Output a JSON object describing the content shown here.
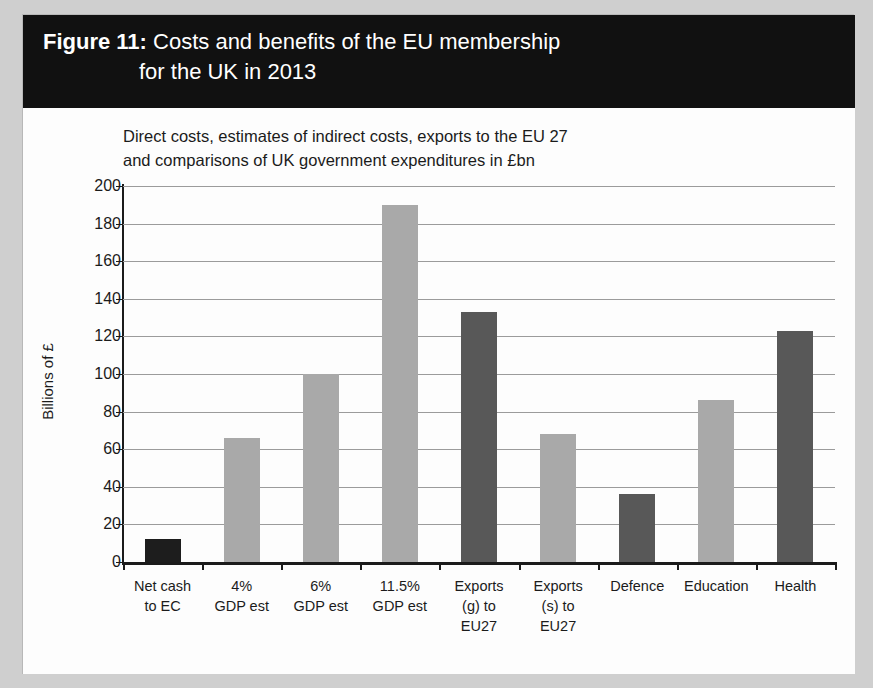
{
  "figure": {
    "label": "Figure 11:",
    "title_line1": "Costs and benefits of the EU membership",
    "title_line2": "for the UK in 2013",
    "banner_bg": "#111111",
    "banner_fg": "#ffffff"
  },
  "chart_data": {
    "type": "bar",
    "title": "Figure 11: Costs and benefits of the EU membership for the UK in 2013",
    "subtitle": "Direct costs, estimates of indirect costs, exports to the EU 27 and comparisons of UK government expenditures in £bn",
    "subtitle_line1": "Direct costs, estimates of indirect costs, exports to the EU 27",
    "subtitle_line2": "and comparisons of UK government expenditures in £bn",
    "xlabel": "",
    "ylabel": "Billions of £",
    "ylim": [
      0,
      200
    ],
    "ytick_step": 20,
    "yticks": [
      200,
      180,
      160,
      140,
      120,
      100,
      80,
      60,
      40,
      20,
      0
    ],
    "ytick_labels": [
      "200",
      "180",
      "160",
      "140",
      "120",
      "100",
      "80",
      "60",
      "40",
      "20",
      "0"
    ],
    "grid": true,
    "legend": "none",
    "categories": [
      "Net cash to EC",
      "4% GDP est",
      "6% GDP est",
      "11.5% GDP est",
      "Exports (g) to EU27",
      "Exports (s) to EU27",
      "Defence",
      "Education",
      "Health"
    ],
    "category_lines": [
      [
        "Net cash",
        "to EC"
      ],
      [
        "4%",
        "GDP est"
      ],
      [
        "6%",
        "GDP est"
      ],
      [
        "11.5%",
        "GDP est"
      ],
      [
        "Exports",
        "(g) to",
        "EU27"
      ],
      [
        "Exports",
        "(s) to",
        "EU27"
      ],
      [
        "Defence"
      ],
      [
        "Education"
      ],
      [
        "Health"
      ]
    ],
    "values": [
      12,
      66,
      100,
      190,
      133,
      68,
      36,
      86,
      123
    ],
    "bar_colors": [
      "#1d1d1d",
      "#a9a9a9",
      "#a9a9a9",
      "#a9a9a9",
      "#585858",
      "#a9a9a9",
      "#585858",
      "#a9a9a9",
      "#585858"
    ]
  },
  "colors": {
    "page_bg": "#cfcfcf",
    "panel_bg": "#fdfdfd",
    "axis": "#1b1b1b",
    "gridline": "#9b9b9b",
    "light_bar": "#a9a9a9",
    "dark_bar": "#585858",
    "black_bar": "#1d1d1d"
  }
}
